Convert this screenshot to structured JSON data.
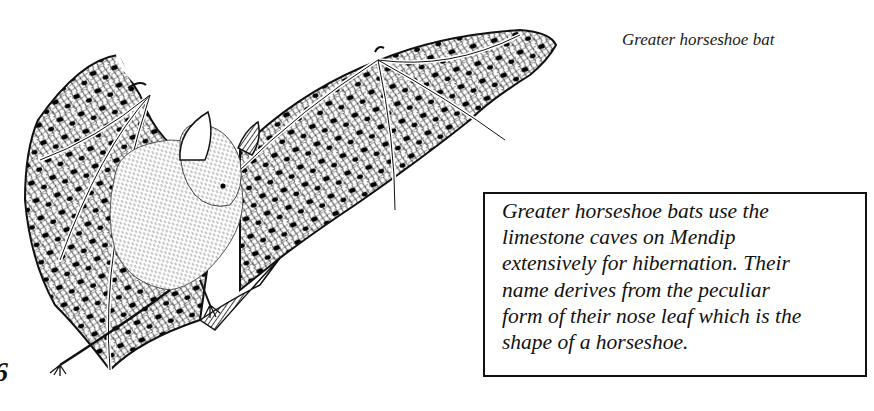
{
  "figure": {
    "caption": "Greater horseshoe bat"
  },
  "info_box": {
    "lines": [
      "Greater horseshoe bats use the",
      "limestone caves on Mendip",
      "extensively for hibernation. Their",
      "name derives from the peculiar",
      "form of their nose leaf which is the",
      "shape of a horseshoe."
    ]
  },
  "page_fragment": "6",
  "colors": {
    "ink": "#111111",
    "paper": "#ffffff"
  }
}
